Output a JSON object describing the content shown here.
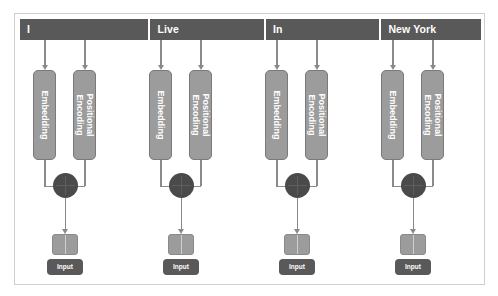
{
  "diagram": {
    "colors": {
      "header_bar": "#595959",
      "block_fill": "#9c9c9c",
      "block_border": "#7a7a7a",
      "sum_node": "#4a4a4a",
      "arrow": "#8a8a8a",
      "chip": "#595959",
      "frame_border": "#cfcfcf",
      "background": "#ffffff",
      "text_on_dark": "#ffffff"
    },
    "sentence": "I Live In New York",
    "tokens": [
      {
        "label": "I",
        "embedding_label": "Embedding",
        "positional_label": "Positional Encoding",
        "sum_operator": "+",
        "input_label": "Input"
      },
      {
        "label": "Live",
        "embedding_label": "Embedding",
        "positional_label": "Positional Encoding",
        "sum_operator": "+",
        "input_label": "Input"
      },
      {
        "label": "In",
        "embedding_label": "Embedding",
        "positional_label": "Positional Encoding",
        "sum_operator": "+",
        "input_label": "Input"
      },
      {
        "label": "New York",
        "embedding_label": "Embedding",
        "positional_label": "Positional Encoding",
        "sum_operator": "+",
        "input_label": "Input"
      }
    ]
  }
}
